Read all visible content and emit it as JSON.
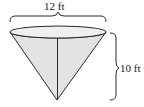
{
  "figure": {
    "type": "cone-diagram",
    "shape": "inverted right circular cone",
    "dimensions": {
      "diameter_label": "12 ft",
      "height_label": "10 ft"
    },
    "colors": {
      "stroke": "#2a2a2a",
      "cone_fill": "#e4e4e4",
      "top_fill": "#eeeeee",
      "background": "#ffffff"
    }
  }
}
